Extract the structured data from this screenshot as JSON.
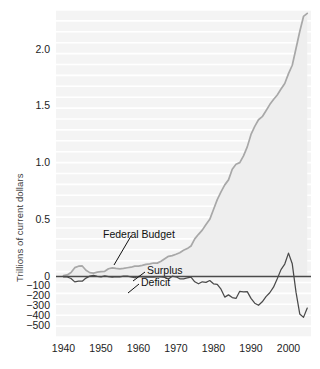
{
  "chart_data": {
    "type": "area",
    "title": "",
    "subtitle": "",
    "xlabel": "",
    "ylabel": "Trillions of current dollars",
    "ylabel_secondary": "Billions of current dollars",
    "xlim": [
      1938,
      2006
    ],
    "ylim_trillions": [
      0,
      2.35
    ],
    "ylim_billions": [
      -550,
      300
    ],
    "grid": true,
    "grid_orientation": "horizontal",
    "legend_position": "inline-annotations",
    "x_ticks": [
      "1940",
      "1950",
      "1960",
      "1970",
      "1980",
      "1990",
      "2000"
    ],
    "x_tick_values": [
      1940,
      1950,
      1960,
      1970,
      1980,
      1990,
      2000
    ],
    "y_ticks_upper": [
      "0",
      "0.5",
      "1.0",
      "1.5",
      "2.0"
    ],
    "y_tick_values_upper": [
      0,
      0.5,
      1.0,
      1.5,
      2.0
    ],
    "y_ticks_lower": [
      "−100",
      "−200",
      "−300",
      "−400",
      "−500"
    ],
    "y_tick_values_lower": [
      -100,
      -200,
      -300,
      -400,
      -500
    ],
    "annotations": [
      {
        "text": "Federal Budget",
        "x": 1962.5,
        "y": 0.38
      },
      {
        "text": "Surplus",
        "x": 1969.5,
        "y": 0.045
      },
      {
        "text": "Deficit",
        "x": 1967.5,
        "y": -0.075
      }
    ],
    "series": [
      {
        "name": "Federal Budget",
        "units": "trillions of current dollars",
        "type": "area",
        "color": "#a8a8a8",
        "fill": "#eeeeee",
        "x": [
          1940,
          1941,
          1942,
          1943,
          1944,
          1945,
          1946,
          1947,
          1948,
          1949,
          1950,
          1951,
          1952,
          1953,
          1954,
          1955,
          1956,
          1957,
          1958,
          1959,
          1960,
          1961,
          1962,
          1963,
          1964,
          1965,
          1966,
          1967,
          1968,
          1969,
          1970,
          1971,
          1972,
          1973,
          1974,
          1975,
          1976,
          1977,
          1978,
          1979,
          1980,
          1981,
          1982,
          1983,
          1984,
          1985,
          1986,
          1987,
          1988,
          1989,
          1990,
          1991,
          1992,
          1993,
          1994,
          1995,
          1996,
          1997,
          1998,
          1999,
          2000,
          2001,
          2002,
          2003,
          2004,
          2005
        ],
        "values": [
          0.009,
          0.014,
          0.035,
          0.078,
          0.091,
          0.093,
          0.055,
          0.034,
          0.03,
          0.039,
          0.043,
          0.046,
          0.068,
          0.076,
          0.071,
          0.068,
          0.071,
          0.077,
          0.082,
          0.092,
          0.092,
          0.098,
          0.107,
          0.111,
          0.119,
          0.118,
          0.135,
          0.157,
          0.178,
          0.184,
          0.196,
          0.21,
          0.231,
          0.246,
          0.269,
          0.332,
          0.372,
          0.409,
          0.459,
          0.504,
          0.591,
          0.678,
          0.746,
          0.808,
          0.852,
          0.946,
          0.99,
          1.004,
          1.064,
          1.143,
          1.253,
          1.324,
          1.382,
          1.409,
          1.462,
          1.516,
          1.561,
          1.601,
          1.653,
          1.702,
          1.789,
          1.863,
          2.011,
          2.16,
          2.293,
          2.32
        ]
      },
      {
        "name": "Surplus or Deficit",
        "units": "billions of current dollars",
        "type": "line",
        "color": "#4a4a4a",
        "x": [
          1940,
          1941,
          1942,
          1943,
          1944,
          1945,
          1946,
          1947,
          1948,
          1949,
          1950,
          1951,
          1952,
          1953,
          1954,
          1955,
          1956,
          1957,
          1958,
          1959,
          1960,
          1961,
          1962,
          1963,
          1964,
          1965,
          1966,
          1967,
          1968,
          1969,
          1970,
          1971,
          1972,
          1973,
          1974,
          1975,
          1976,
          1977,
          1978,
          1979,
          1980,
          1981,
          1982,
          1983,
          1984,
          1985,
          1986,
          1987,
          1988,
          1989,
          1990,
          1991,
          1992,
          1993,
          1994,
          1995,
          1996,
          1997,
          1998,
          1999,
          2000,
          2001,
          2002,
          2003,
          2004,
          2005
        ],
        "values": [
          -2.9,
          -4.9,
          -20.5,
          -54.6,
          -47.6,
          -47.6,
          -15.9,
          4.0,
          11.8,
          0.6,
          -3.1,
          6.1,
          -1.5,
          -6.5,
          -1.2,
          -3.0,
          3.9,
          3.4,
          -2.8,
          -12.8,
          0.3,
          -3.3,
          -7.1,
          -4.8,
          -5.9,
          -1.4,
          -3.7,
          -8.6,
          -25.2,
          3.2,
          -2.8,
          -23.0,
          -23.4,
          -14.9,
          -6.1,
          -53.2,
          -73.7,
          -53.7,
          -59.2,
          -40.7,
          -73.8,
          -79.0,
          -128.0,
          -207.8,
          -185.4,
          -212.3,
          -221.2,
          -149.7,
          -155.2,
          -152.6,
          -221.0,
          -269.2,
          -290.3,
          -255.1,
          -203.2,
          -164.0,
          -107.4,
          -21.9,
          69.3,
          125.6,
          236.2,
          128.2,
          -157.8,
          -377.6,
          -412.7,
          -318.3
        ]
      }
    ]
  },
  "axes": {
    "ylabel": "Trillions of current dollars"
  },
  "series_labels": {
    "budget": "Federal Budget",
    "surplus": "Surplus",
    "deficit": "Deficit"
  },
  "colors": {
    "budget_line": "#a8a8a8",
    "budget_fill": "#eeeeee",
    "deficit_line": "#4a4a4a",
    "zero_line": "#4a4a4a",
    "plot_background": "#f4f4f4",
    "gridline": "#ffffff",
    "text": "#1d1d1d"
  }
}
